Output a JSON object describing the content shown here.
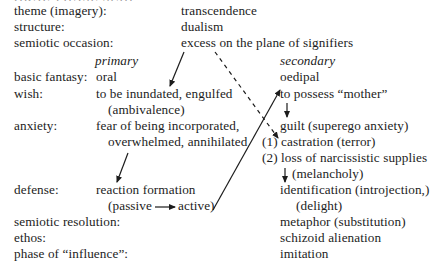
{
  "header_fragment": "ORAL-PHASE SCHEMA",
  "rows": [
    {
      "label": "theme (imagery):",
      "value": "transcendence"
    },
    {
      "label": "structure:",
      "value": "dualism"
    },
    {
      "label": "semiotic occasion:",
      "value": "excess on the plane of signifiers"
    }
  ],
  "columns": {
    "primary": "primary",
    "secondary": "secondary"
  },
  "basic_fantasy": {
    "label": "basic fantasy:",
    "primary": "oral",
    "secondary": "oedipal"
  },
  "wish": {
    "label": "wish:",
    "primary": "to be inundated, engulfed",
    "primary_sub": "(ambivalence)",
    "secondary": "to possess “mother”"
  },
  "anxiety": {
    "label": "anxiety:",
    "primary": "fear of being incorporated,",
    "primary_sub": "overwhelmed, annihilated",
    "secondary": "guilt (superego anxiety)",
    "secondary_items": [
      "(1) castration (terror)",
      "(2) loss of narcissistic supplies",
      "(melancholy)"
    ]
  },
  "defense": {
    "label": "defense:",
    "primary": "reaction formation",
    "primary_sub_left": "(passive",
    "primary_sub_right": "active)",
    "secondary": "identification (introjection,)",
    "secondary_sub": "(delight)"
  },
  "tail_rows": [
    {
      "label": "semiotic resolution:",
      "value": "metaphor (substitution)"
    },
    {
      "label": "ethos:",
      "value": "schizoid alienation"
    },
    {
      "label": "phase of “influence”:",
      "value": "imitation"
    }
  ],
  "icons": {
    "arrow_solid": "arrow-solid",
    "arrow_dashed": "arrow-dashed"
  }
}
